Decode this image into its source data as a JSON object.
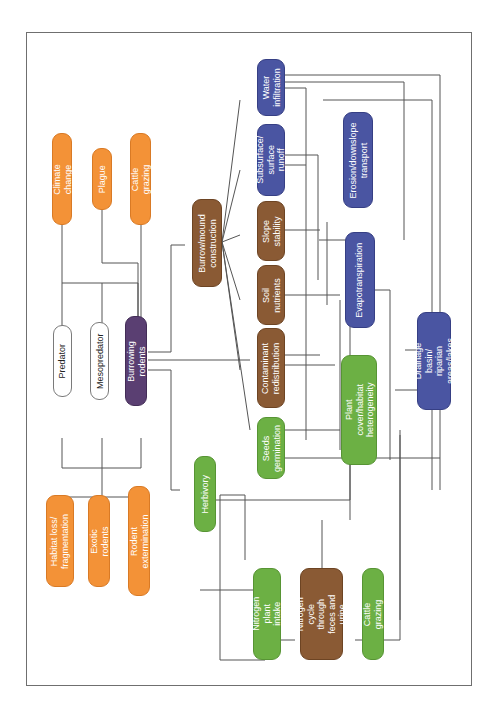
{
  "diagram": {
    "title": "",
    "orientation": "rotated -90deg (text reads bottom-to-top)",
    "colors": {
      "external_driver": "#f39237",
      "burrowing_process": "#8a5a34",
      "hydrology": "#4a55a2",
      "vegetation": "#6cb044",
      "focal_species": "#5a3f72",
      "trophic": "#ffffff",
      "connector": "#555555"
    },
    "nodes": {
      "climate_change": "Climate change",
      "plague": "Plague",
      "cattle_grazing_top": "Cattle grazing",
      "predator": "Predator",
      "mesopredator": "Mesopredator",
      "burrowing_rodents": "Burrowing rodents",
      "burrow_mound": "Burrow/mound construction",
      "habitat_loss": "Habitat loss/ fragmentation",
      "exotic_rodents": "Exotic rodents",
      "rodent_extermination": "Rodent extermination",
      "herbivory": "Herbivory",
      "water_infiltration": "Water infiltration",
      "subsurface_runoff": "Subsurface/ surface runoff",
      "slope_stability": "Slope stability",
      "soil_nutrients": "Soil nutrients",
      "contaminant_redistribution": "Contaminant redistribution",
      "seeds_germination": "Seeds germination",
      "erosion": "Erosion/downslope transport",
      "evapotranspiration": "Evapotranspiration",
      "plant_cover": "Plant cover/habitat heterogeneity",
      "drainage_basin": "Drainage basin/ riparian areas/lakes",
      "nitrogen_intake": "Nitrogen plant intake",
      "nitrogen_cycle": "Nitrogen cycle through feces and urine",
      "cattle_grazing_bottom": "Cattle grazing"
    }
  }
}
